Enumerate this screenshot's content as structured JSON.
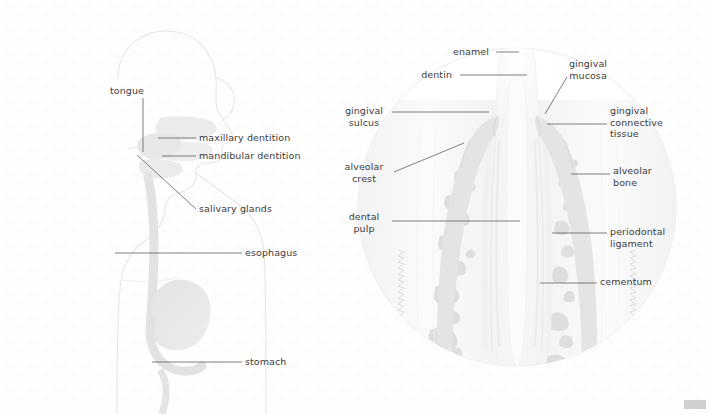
{
  "figure": {
    "domain": "anatomy-illustration",
    "panels": [
      {
        "id": "panel-left",
        "name": "digestive-tract-head-torso-sagittal"
      },
      {
        "id": "panel-right",
        "name": "tooth-periodontium-cross-section"
      }
    ]
  },
  "ink": {
    "text": "#3c3c3c",
    "leader": "#4a4a4a",
    "silhouette": "#e4e4e4",
    "organ": "#e0e0e0",
    "enamel": "#fbfbfb",
    "dentin": "#f4f4f4",
    "pulp": "#fafafa",
    "gingiva": "#e2e2e2",
    "bone": "#ededed",
    "trabecula": "#dcdcdc",
    "circle_edge": "#e8e8e8",
    "corner_box": "#cfcfcf",
    "page_bg": "#fefefe"
  },
  "left_panel": {
    "name": "digestive-tract-overview",
    "labels": [
      {
        "id": "tongue",
        "text": "tongue",
        "x": 110,
        "y": 88,
        "align": "left",
        "leader": "vertical-down-to-tongue"
      },
      {
        "id": "maxillary-dentition",
        "text": "maxillary dentition",
        "x": 199,
        "y": 134,
        "align": "left",
        "leader": "horizontal-left"
      },
      {
        "id": "mandibular-dentition",
        "text": "mandibular dentition",
        "x": 199,
        "y": 152,
        "align": "left",
        "leader": "horizontal-left"
      },
      {
        "id": "salivary-glands",
        "text": "salivary glands",
        "x": 199,
        "y": 205,
        "align": "left",
        "leader": "diagonal-up-left"
      },
      {
        "id": "esophagus",
        "text": "esophagus",
        "x": 245,
        "y": 249,
        "align": "left",
        "leader": "horizontal-left"
      },
      {
        "id": "stomach",
        "text": "stomach",
        "x": 245,
        "y": 358,
        "align": "left",
        "leader": "horizontal-left"
      }
    ]
  },
  "right_panel": {
    "name": "tooth-and-supporting-structures",
    "labels": [
      {
        "id": "enamel",
        "text": "enamel",
        "x": 489,
        "y": 47,
        "align": "right",
        "leader": "short-horizontal-right"
      },
      {
        "id": "dentin",
        "text": "dentin",
        "x": 452,
        "y": 70,
        "align": "right",
        "leader": "long-horizontal-right"
      },
      {
        "id": "gingival-mucosa",
        "text": "gingival\nmucosa",
        "x": 568,
        "y": 60,
        "align": "left",
        "leader": "diagonal-down-left"
      },
      {
        "id": "gingival-sulcus",
        "text": "gingival\nsulcus",
        "x": 388,
        "y": 107,
        "align": "right",
        "leader": "horizontal-right"
      },
      {
        "id": "gingival-connective-tissue",
        "text": "gingival\nconnective\ntissue",
        "x": 610,
        "y": 107,
        "align": "left",
        "leader": "horizontal-left"
      },
      {
        "id": "alveolar-crest",
        "text": "alveolar\ncrest",
        "x": 362,
        "y": 163,
        "align": "right",
        "leader": "diagonal-up-right"
      },
      {
        "id": "alveolar-bone",
        "text": "alveolar\nbone",
        "x": 613,
        "y": 167,
        "align": "left",
        "leader": "horizontal-left"
      },
      {
        "id": "dental-pulp",
        "text": "dental\npulp",
        "x": 363,
        "y": 213,
        "align": "right",
        "leader": "horizontal-right"
      },
      {
        "id": "periodontal-ligament",
        "text": "periodontal\nligament",
        "x": 610,
        "y": 228,
        "align": "left",
        "leader": "horizontal-left"
      },
      {
        "id": "cementum",
        "text": "cementum",
        "x": 600,
        "y": 278,
        "align": "left",
        "leader": "horizontal-left"
      }
    ]
  }
}
